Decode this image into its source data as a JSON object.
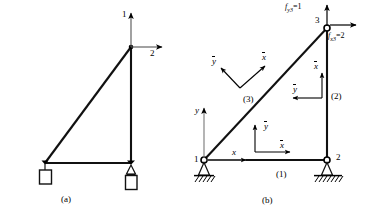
{
  "figure": {
    "captions": {
      "a": "(a)",
      "b": "(b)"
    },
    "colors": {
      "line": "#000000",
      "member": "#1a1a1a",
      "ground": "#000000",
      "background": "#ffffff"
    }
  },
  "panel_a": {
    "caption": "(a)",
    "dof_labels": {
      "vertical": "1",
      "horizontal": "2"
    },
    "description": "Right-triangle truss with degree-of-freedom arrows at apex node",
    "supports": {
      "left": "hanging-weight-support",
      "right": "pin-support-with-weight"
    }
  },
  "panel_b": {
    "caption": "(b)",
    "nodes": [
      {
        "id": "1",
        "label": "1"
      },
      {
        "id": "2",
        "label": "2"
      },
      {
        "id": "3",
        "label": "3"
      }
    ],
    "elements": [
      {
        "id": "1",
        "label": "(1)"
      },
      {
        "id": "2",
        "label": "(2)"
      },
      {
        "id": "3",
        "label": "(3)"
      }
    ],
    "forces": [
      {
        "id": "fy3",
        "label": "f",
        "sub": "y3",
        "eq": "=1"
      },
      {
        "id": "fx3",
        "label": "f",
        "sub": "x3",
        "eq": "=2"
      }
    ],
    "global_axes": {
      "x": "x",
      "y": "y"
    },
    "local_axes": {
      "element1": {
        "x": "x",
        "y": "y"
      },
      "element2": {
        "x": "x",
        "y": "y"
      },
      "element3": {
        "x": "x",
        "y": "y"
      }
    }
  }
}
